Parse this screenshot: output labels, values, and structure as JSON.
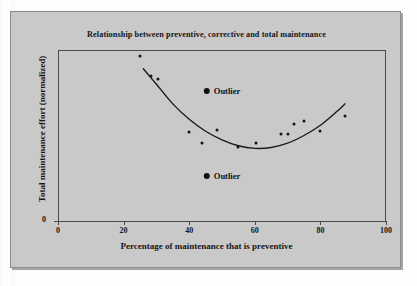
{
  "figure": {
    "background_color": "#c9c9c9",
    "page_color": "#fdfdfd",
    "frame_color": "#4a4a4a",
    "marker_color": "#141414"
  },
  "chart_data": {
    "type": "scatter",
    "title": "Relationship between preventive, corrective and total maintenance",
    "xlabel": "Percentage of maintenance that is preventive",
    "ylabel": "Total maintenance effort (normalized)",
    "xlim": [
      0,
      100
    ],
    "ylim": [
      0,
      100
    ],
    "grid": false,
    "legend": "none",
    "xticks": [
      0,
      20,
      40,
      60,
      80,
      100
    ],
    "xtick_labels": [
      "0",
      "20",
      "40",
      "60",
      "80",
      "100"
    ],
    "yticks": [
      0
    ],
    "ytick_labels": [
      "0"
    ],
    "series": [
      {
        "name": "Observations",
        "marker": "filled-circle",
        "points": [
          {
            "x": 25.0,
            "y": 96.5
          },
          {
            "x": 28.5,
            "y": 85.0
          },
          {
            "x": 30.5,
            "y": 83.0
          },
          {
            "x": 40.0,
            "y": 52.0
          },
          {
            "x": 44.0,
            "y": 45.5
          },
          {
            "x": 48.5,
            "y": 53.5
          },
          {
            "x": 55.0,
            "y": 43.0
          },
          {
            "x": 60.5,
            "y": 45.5
          },
          {
            "x": 68.0,
            "y": 51.0
          },
          {
            "x": 70.0,
            "y": 51.0
          },
          {
            "x": 72.0,
            "y": 56.5
          },
          {
            "x": 75.0,
            "y": 58.5
          },
          {
            "x": 80.0,
            "y": 52.5
          },
          {
            "x": 87.5,
            "y": 61.5
          }
        ]
      }
    ],
    "trend_curve": {
      "name": "Fitted quadratic trend",
      "points": [
        {
          "x": 26.0,
          "y": 89.0
        },
        {
          "x": 30.0,
          "y": 80.0
        },
        {
          "x": 35.0,
          "y": 68.5
        },
        {
          "x": 40.0,
          "y": 59.5
        },
        {
          "x": 45.0,
          "y": 52.5
        },
        {
          "x": 50.0,
          "y": 47.5
        },
        {
          "x": 55.0,
          "y": 44.0
        },
        {
          "x": 60.0,
          "y": 42.5
        },
        {
          "x": 65.0,
          "y": 43.0
        },
        {
          "x": 70.0,
          "y": 45.5
        },
        {
          "x": 75.0,
          "y": 50.0
        },
        {
          "x": 80.0,
          "y": 56.0
        },
        {
          "x": 85.0,
          "y": 64.0
        },
        {
          "x": 87.5,
          "y": 68.5
        }
      ]
    },
    "annotations": [
      {
        "label": "Outlier",
        "x": 50.0,
        "y": 76.0,
        "marker": "filled-circle"
      },
      {
        "label": "Outlier",
        "x": 50.0,
        "y": 26.5,
        "marker": "filled-circle"
      }
    ]
  }
}
